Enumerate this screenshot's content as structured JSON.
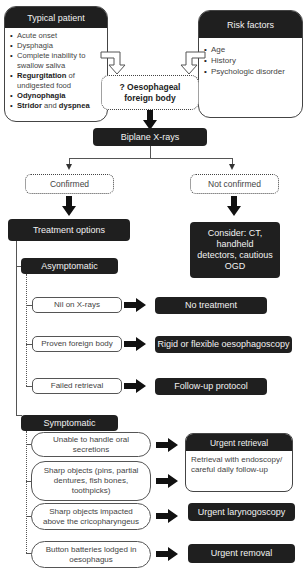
{
  "typical_patient": {
    "title": "Typical patient",
    "items": [
      {
        "bold": "",
        "text": "Acute onset"
      },
      {
        "bold": "",
        "text": "Dysphagia"
      },
      {
        "bold": "",
        "text": "Complete inability to swallow saliva"
      },
      {
        "bold": "Regurgitation",
        "text": " of undigested food"
      },
      {
        "bold": "Odynophagia",
        "text": ""
      },
      {
        "bold": "Stridor",
        "text": " and ",
        "bold2": "dyspnea"
      }
    ]
  },
  "risk_factors": {
    "title": "Risk factors",
    "items": [
      "Age",
      "History",
      "Psychologic disorder"
    ]
  },
  "suspect": "? Oesophageal foreign body",
  "investigation": "Biplane X-rays",
  "branches": {
    "confirmed": "Confirmed",
    "not_confirmed": "Not confirmed"
  },
  "treatment_options": "Treatment options",
  "consider": "Consider: CT, handheld detectors, cautious OGD",
  "asymptomatic": {
    "label": "Asymptomatic",
    "rows": [
      {
        "condition": "Nil on X-rays",
        "action": "No treatment"
      },
      {
        "condition": "Proven foreign body",
        "action": "Rigid or flexible oesophagoscopy"
      },
      {
        "condition": "Failed retrieval",
        "action": "Follow-up protocol"
      }
    ]
  },
  "symptomatic": {
    "label": "Symptomatic",
    "rows": [
      {
        "condition": "Unable to handle oral secretions"
      },
      {
        "condition": "Sharp objects (pins, partial dentures, fish bones, toothpicks)"
      },
      {
        "condition": "Sharp objects impacted above the cricopharyngeus",
        "action": "Urgent larynogoscopy"
      },
      {
        "condition": "Button batteries lodged in oesophagus",
        "action": "Urgent removal"
      }
    ],
    "urgent_retrieval": {
      "title": "Urgent retrieval",
      "body": "Retrieval with endoscopy/ careful daily follow-up"
    }
  },
  "colors": {
    "dark_box": "#1f1f1f",
    "border": "#555555",
    "text": "#444444"
  }
}
